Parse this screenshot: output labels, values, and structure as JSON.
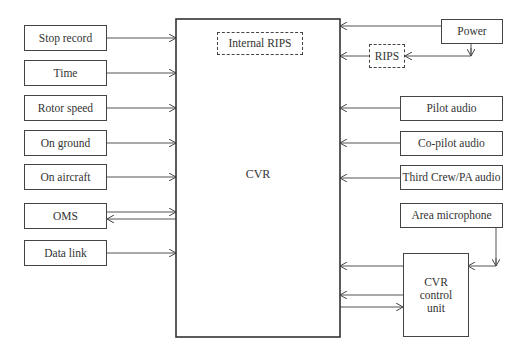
{
  "diagram": {
    "center": {
      "label": "CVR",
      "internal": "Internal RIPS"
    },
    "inputs_left": [
      {
        "label": "Stop record",
        "direction": "to_cvr"
      },
      {
        "label": "Time",
        "direction": "to_cvr"
      },
      {
        "label": "Rotor speed",
        "direction": "to_cvr"
      },
      {
        "label": "On ground",
        "direction": "to_cvr"
      },
      {
        "label": "On aircraft",
        "direction": "to_cvr"
      },
      {
        "label": "OMS",
        "direction": "bidirectional"
      },
      {
        "label": "Data link",
        "direction": "to_cvr"
      }
    ],
    "inputs_right": [
      {
        "label": "Power"
      },
      {
        "label": "RIPS"
      },
      {
        "label": "Pilot audio"
      },
      {
        "label": "Co-pilot audio"
      },
      {
        "label": "Third Crew/PA audio"
      },
      {
        "label": "Area microphone"
      }
    ],
    "control_unit": {
      "label": "CVR control unit",
      "line1": "CVR",
      "line2": "control",
      "line3": "unit"
    }
  }
}
